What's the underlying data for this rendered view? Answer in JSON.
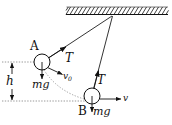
{
  "figure": {
    "kind": "physics-free-body-pendulum-diagram",
    "width": 172,
    "height": 125,
    "background_color": "#ffffff",
    "stroke_color": "#111111",
    "dotted_color": "#9a9a9a"
  },
  "ceiling": {
    "name": "hatched-ceiling",
    "x_start": 66,
    "x_end": 168,
    "y": 14,
    "hatch_count": 26
  },
  "pivot": {
    "x": 112,
    "y": 15
  },
  "bob_a": {
    "label": "A",
    "cx": 42,
    "cy": 62,
    "r": 8,
    "tension_label": "T",
    "weight_label": "mg",
    "velocity_label": "v",
    "velocity_subscript": "0"
  },
  "bob_b": {
    "label": "B",
    "cx": 92,
    "cy": 96,
    "r": 8,
    "tension_label": "T",
    "weight_label": "mg",
    "velocity_label": "v"
  },
  "height_measure": {
    "label": "h",
    "x": 12,
    "y_top": 62,
    "y_bottom": 101
  },
  "reference_lines": {
    "top": {
      "x_start": 2,
      "x_end": 36,
      "y": 62
    },
    "bottom": {
      "x_start": 2,
      "x_end": 88,
      "y": 101
    }
  },
  "labels": {
    "a": "A",
    "b": "B",
    "t_a": "T",
    "t_b": "T",
    "mg_a": "mg",
    "mg_b": "mg",
    "v0": "v",
    "v0_sub": "0",
    "v_b": "v",
    "h": "h"
  }
}
